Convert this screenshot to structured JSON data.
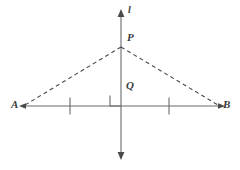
{
  "figure": {
    "stroke_color": "#666666",
    "dash_color": "#4a4a4a",
    "label_color": "#3a3a3a",
    "background_color": "#ffffff"
  },
  "labels": {
    "line": "l",
    "apex": "P",
    "foot": "Q",
    "left_endpoint": "A",
    "right_endpoint": "B"
  },
  "geometry": {
    "line_l": {
      "name": "vertical-line",
      "x": 121,
      "y_top": 14,
      "y_bottom": 155,
      "arrow_top": true,
      "arrow_bottom": true
    },
    "segment_ab": {
      "name": "horizontal-segment",
      "y": 106,
      "x_left": 22,
      "x_right": 222,
      "arrow_left": true,
      "arrow_right": true
    },
    "point_p": {
      "x": 121,
      "y": 47
    },
    "point_q": {
      "x": 121,
      "y": 106
    },
    "point_a": {
      "x": 22,
      "y": 106
    },
    "point_b": {
      "x": 222,
      "y": 106
    },
    "dashed_pa": {
      "name": "dashed-segment-PA",
      "x1": 121,
      "y1": 47,
      "x2": 24,
      "y2": 105
    },
    "dashed_pb": {
      "name": "dashed-segment-PB",
      "x1": 121,
      "y1": 47,
      "x2": 219,
      "y2": 105
    },
    "tick_left": {
      "x": 70,
      "y_top": 98,
      "y_bottom": 114
    },
    "tick_right": {
      "x": 169,
      "y_top": 98,
      "y_bottom": 114
    },
    "right_angle_marker": {
      "x": 110,
      "y": 95,
      "size": 11
    }
  }
}
